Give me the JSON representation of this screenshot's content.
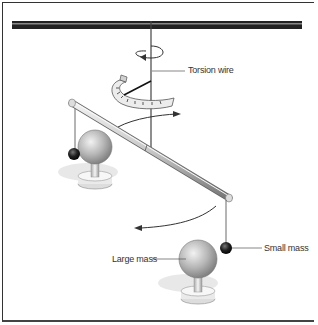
{
  "diagram": {
    "labels": {
      "torsion_wire": "Torsion wire",
      "small_mass": "Small mass",
      "large_mass": "Large mass"
    },
    "colors": {
      "line": "#333333",
      "sphere_light": "#e8e8e8",
      "sphere_dark": "#8a8a8a",
      "small_mass": "#111111",
      "shadow": "#e6e6e6"
    }
  }
}
